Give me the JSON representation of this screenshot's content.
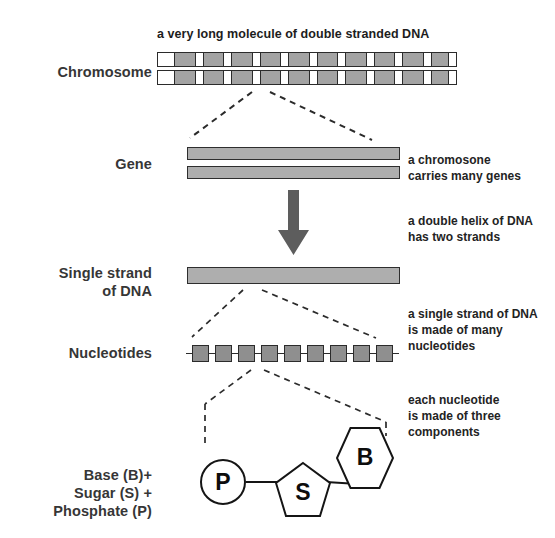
{
  "diagram": {
    "title": "a very long molecule of double stranded DNA",
    "row_labels": {
      "chromosome": "Chromosome",
      "gene": "Gene",
      "single_strand_line1": "Single strand",
      "single_strand_line2": "of DNA",
      "nucleotides": "Nucleotides",
      "components_line1": "Base (B)+",
      "components_line2": "Sugar (S) +",
      "components_line3": "Phosphate (P)"
    },
    "captions": [
      {
        "id": "gene-caption",
        "line1": "a chromosone",
        "line2": "carries many genes"
      },
      {
        "id": "helix-caption",
        "line1": "a double helix of DNA",
        "line2": "has two strands"
      },
      {
        "id": "strand-caption",
        "line1": "a single strand of DNA",
        "line2": "is made of many",
        "line3": "nucleotides"
      },
      {
        "id": "nucleotide-caption",
        "line1": "each nucleotide",
        "line2": "is made of three",
        "line3": "components"
      }
    ],
    "components": {
      "phosphate_symbol": "P",
      "sugar_symbol": "S",
      "base_symbol": "B"
    },
    "chromosome": {
      "segment_count": 21,
      "segments": [
        "w",
        "g",
        "w",
        "g",
        "w",
        "g",
        "w",
        "g",
        "w",
        "g",
        "w",
        "g",
        "w",
        "g",
        "w",
        "g",
        "w",
        "g",
        "w",
        "g",
        "w"
      ],
      "segment_widths": [
        26,
        32,
        11,
        32,
        11,
        32,
        11,
        32,
        11,
        32,
        11,
        32,
        11,
        32,
        11,
        32,
        11,
        32,
        11,
        26,
        12
      ]
    },
    "nucleotide_chain": {
      "box_count": 9
    },
    "colors": {
      "fill_gray": "#a3a3a3",
      "bar_gray": "#aeaeae",
      "nucleotide_gray": "#8f8f8f",
      "outline": "#2b2b2b",
      "arrow": "#5d5d5d",
      "text": "#232323",
      "background": "#ffffff"
    }
  }
}
